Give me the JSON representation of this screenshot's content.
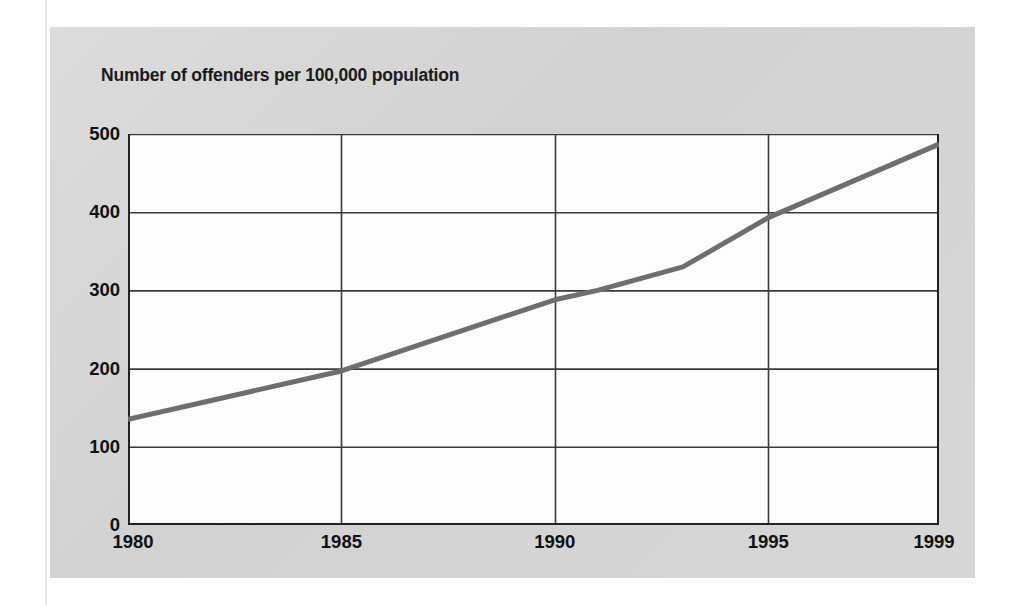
{
  "figure": {
    "title": "Number of offenders per 100,000 population",
    "panel_color": "#d5d5d5",
    "plot_background": "#fdfdfd",
    "grid_color": "#3a3a3a",
    "line_color": "#6e6e6e"
  },
  "chart_data": {
    "type": "line",
    "title": "Number of offenders per 100,000 population",
    "xlabel": "",
    "ylabel": "",
    "xlim": [
      1980,
      1999
    ],
    "ylim": [
      0,
      500
    ],
    "grid": true,
    "legend": null,
    "x_tick_labels": [
      "1980",
      "1985",
      "1990",
      "1995",
      "1999"
    ],
    "x_ticks": [
      1980,
      1985,
      1990,
      1995,
      1999
    ],
    "y_tick_labels": [
      "0",
      "100",
      "200",
      "300",
      "400",
      "500"
    ],
    "y_ticks": [
      0,
      100,
      200,
      300,
      400,
      500
    ],
    "series": [
      {
        "name": "Offenders per 100,000 population",
        "color": "#6e6e6e",
        "x": [
          1980,
          1985,
          1990,
          1991,
          1993,
          1995,
          1999
        ],
        "values": [
          135,
          197,
          288,
          300,
          330,
          393,
          487
        ]
      }
    ]
  }
}
